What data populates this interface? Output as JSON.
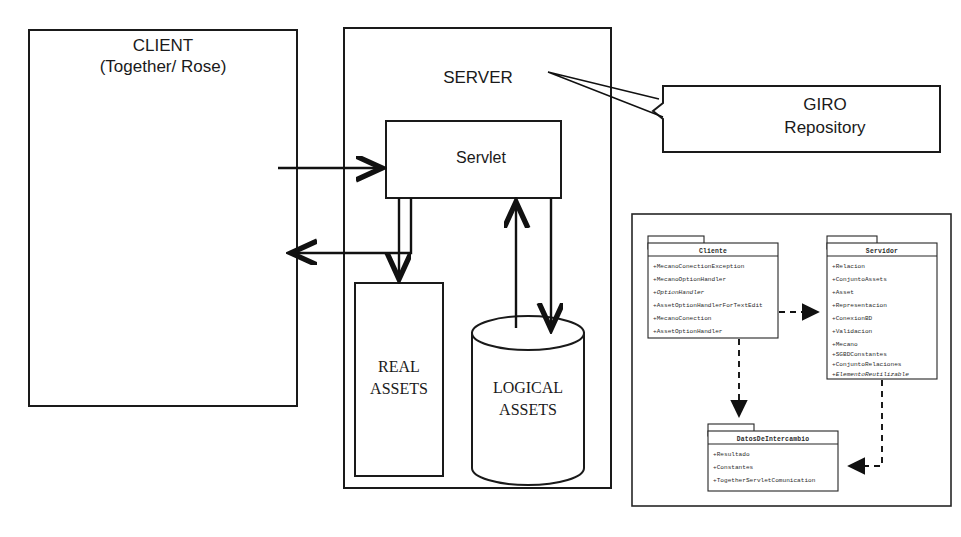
{
  "diagram": {
    "colors": {
      "ink": "#1a1a1a",
      "stroke": "#111111",
      "paper": "#ffffff"
    }
  },
  "client": {
    "title_line1": "CLIENT",
    "title_line2": "(Together/ Rose)",
    "thumbnail_name": "client-app-screenshot"
  },
  "server": {
    "title": "SERVER",
    "servlet_label": "Servlet",
    "real_assets_line1": "REAL",
    "real_assets_line2": "ASSETS",
    "logical_assets_line1": "LOGICAL",
    "logical_assets_line2": "ASSETS"
  },
  "giro": {
    "line1": "GIRO",
    "line2": "Repository"
  },
  "uml": {
    "packages": [
      {
        "name": "Cliente",
        "attributes": [
          {
            "text": "+MecanoConectionException",
            "italic": false
          },
          {
            "text": "+MecanoOptionHandler",
            "italic": false
          },
          {
            "text": "+OptionHandler",
            "italic": true
          },
          {
            "text": "+AssetOptionHandlerForTextEdit",
            "italic": false
          },
          {
            "text": "+MecanoConection",
            "italic": false
          },
          {
            "text": "+AssetOptionHandler",
            "italic": false
          }
        ]
      },
      {
        "name": "Servidor",
        "attributes": [
          {
            "text": "+Relacion",
            "italic": false
          },
          {
            "text": "+ConjuntoAssets",
            "italic": false
          },
          {
            "text": "+Asset",
            "italic": false
          },
          {
            "text": "+Representacion",
            "italic": false
          },
          {
            "text": "+ConexionBD",
            "italic": false
          },
          {
            "text": "+Validacion",
            "italic": false
          },
          {
            "text": "+Mecano",
            "italic": false
          },
          {
            "text": "+SGBDConstantes",
            "italic": false
          },
          {
            "text": "+ConjuntoRelaciones",
            "italic": false
          },
          {
            "text": "+ElementoReutilizable",
            "italic": true
          }
        ]
      },
      {
        "name": "DatosDeIntercambio",
        "attributes": [
          {
            "text": "+Resultado",
            "italic": false
          },
          {
            "text": "+Constantes",
            "italic": false
          },
          {
            "text": "+TogetherServletComunication",
            "italic": false
          }
        ]
      }
    ]
  }
}
